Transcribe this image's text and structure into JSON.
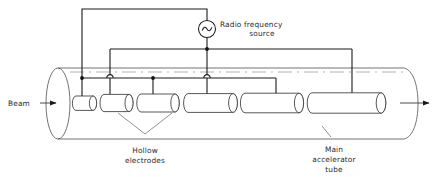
{
  "figure": {
    "type": "diagram"
  },
  "labels": {
    "beam": "Beam",
    "rf_source_line1": "Radio frequency",
    "rf_source_line2": "source",
    "hollow_electrodes_line1": "Hollow",
    "hollow_electrodes_line2": "electrodes",
    "main_tube_line1": "Main",
    "main_tube_line2": "accelerator",
    "main_tube_line3": "tube"
  },
  "icons": {
    "rf_source": "ac-source-icon",
    "beam_in_arrow": "arrow-right-icon",
    "beam_out_arrow": "arrow-right-icon"
  },
  "colors": {
    "wire": "#1a1a1a",
    "tube": "#555a5c",
    "electrode_stroke": "#3a3a3a",
    "electrode_fill": "#ffffff",
    "leader": "#6a6f72",
    "axis": "#8d9295",
    "text": "#2b2b2b",
    "background": "#ffffff"
  },
  "geometry": {
    "width": 434,
    "height": 182,
    "tube": {
      "top_y": 68,
      "bottom_y": 139,
      "left_x": 58,
      "right_x": 404,
      "left_cap_rx": 12,
      "right_cap_rx": 14,
      "axis_y": 103.5
    },
    "bus_upper_y": 49,
    "bus_lower_y": 78,
    "top_rail_y": 9,
    "source": {
      "cx": 207,
      "cy": 29,
      "r": 8.5
    },
    "beam_arrow": {
      "x1": 13,
      "x2": 56,
      "y": 103
    },
    "exit_arrow": {
      "x1": 402,
      "x2": 431,
      "y": 103
    }
  },
  "electrodes": [
    {
      "id": 1,
      "x": 73,
      "length": 24,
      "stem_x": 82,
      "bus": "lower",
      "connection": "dot"
    },
    {
      "id": 2,
      "x": 100,
      "length": 34,
      "stem_x": 110,
      "bus": "upper",
      "connection": "hop"
    },
    {
      "id": 3,
      "x": 137,
      "length": 43,
      "stem_x": 153,
      "bus": "lower",
      "connection": "dot"
    },
    {
      "id": 4,
      "x": 184,
      "length": 54,
      "stem_x": 207,
      "bus": "upper",
      "connection": "hop"
    },
    {
      "id": 5,
      "x": 241,
      "length": 63,
      "stem_x": 276,
      "bus": "lower",
      "connection": "corner"
    },
    {
      "id": 6,
      "x": 308,
      "length": 76,
      "stem_x": 352,
      "bus": "upper-right",
      "connection": "corner"
    }
  ],
  "wiring": {
    "left_riser_x": 82,
    "right_riser_x": 352,
    "upper_bus_left_x": 110,
    "upper_bus_right_x": 352,
    "lower_bus_left_x": 82,
    "lower_bus_right_x": 276,
    "source_stem_x": 207
  },
  "leaders": {
    "hollow_electrodes": {
      "apex_x": 145,
      "apex_y": 134,
      "from_a_x": 118,
      "from_a_y": 113,
      "from_b_x": 172,
      "from_b_y": 113,
      "text_x": 145,
      "text_y": 152
    },
    "main_tube": {
      "x1": 330,
      "y1": 137,
      "x2": 321,
      "y2": 127,
      "text_x": 330,
      "text_y": 150
    }
  }
}
